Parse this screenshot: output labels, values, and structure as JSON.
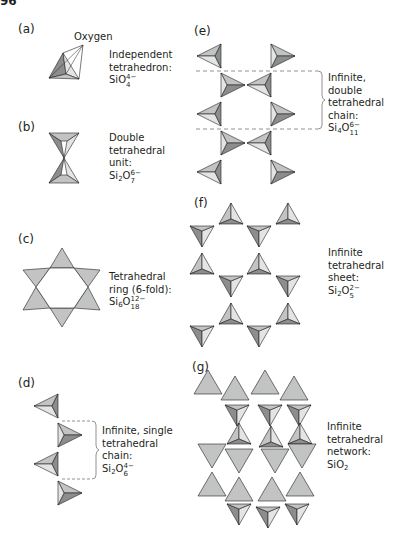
{
  "page_number": "96",
  "colors": {
    "light": "#e3e4e4",
    "mid": "#c2c3c3",
    "dark": "#8c8d8e",
    "stroke": "#231f20",
    "dash": "#777777"
  },
  "panels": [
    {
      "id": "a",
      "label": "(a)",
      "annotation": "Oxygen",
      "caption_lines": [
        "Independent",
        "tetrahedron:"
      ],
      "formula": {
        "base": "SiO",
        "sub": "4",
        "sup": "4−"
      }
    },
    {
      "id": "b",
      "label": "(b)",
      "caption_lines": [
        "Double",
        "tetrahedral",
        "unit:"
      ],
      "formula": {
        "base1": "Si",
        "sub1": "2",
        "base2": "O",
        "sub2": "7",
        "sup": "6−"
      }
    },
    {
      "id": "c",
      "label": "(c)",
      "caption_lines": [
        "Tetrahedral",
        "ring (6-fold):"
      ],
      "formula": {
        "base1": "Si",
        "sub1": "6",
        "base2": "O",
        "sub2": "18",
        "sup": "12−"
      }
    },
    {
      "id": "d",
      "label": "(d)",
      "caption_lines": [
        "Infinite, single",
        "tetrahedral",
        "chain:"
      ],
      "formula": {
        "base1": "Si",
        "sub1": "2",
        "base2": "O",
        "sub2": "6",
        "sup": "4−"
      }
    },
    {
      "id": "e",
      "label": "(e)",
      "caption_lines": [
        "Infinite, double",
        "tetrahedral",
        "chain:"
      ],
      "formula": {
        "base1": "Si",
        "sub1": "4",
        "base2": "O",
        "sub2": "11",
        "sup": "6−"
      }
    },
    {
      "id": "f",
      "label": "(f)",
      "caption_lines": [
        "Infinite",
        "tetrahedral",
        "sheet:"
      ],
      "formula": {
        "base1": "Si",
        "sub1": "2",
        "base2": "O",
        "sub2": "5",
        "sup": "2−"
      }
    },
    {
      "id": "g",
      "label": "(g)",
      "caption_lines": [
        "Infinite",
        "tetrahedral",
        "network:"
      ],
      "formula": {
        "base1": "SiO",
        "sub1": "2"
      }
    }
  ]
}
